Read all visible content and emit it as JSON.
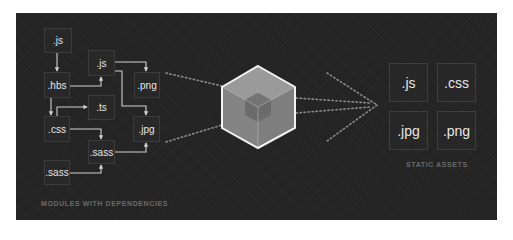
{
  "diagram": {
    "colors": {
      "background": "#242424",
      "box_border": "#3b3b3b",
      "text": "#e6e6e6",
      "arrow": "#cfcfcf",
      "dots": "#8a8a8a",
      "caption": "#6a6a6a"
    },
    "modules": {
      "caption": "MODULES WITH DEPENDENCIES",
      "items": [
        {
          "id": "js1",
          "label": ".js"
        },
        {
          "id": "js2",
          "label": ".js"
        },
        {
          "id": "hbs",
          "label": ".hbs"
        },
        {
          "id": "png",
          "label": ".png"
        },
        {
          "id": "ts",
          "label": ".ts"
        },
        {
          "id": "css",
          "label": ".css"
        },
        {
          "id": "jpg",
          "label": ".jpg"
        },
        {
          "id": "sass1",
          "label": ".sass"
        },
        {
          "id": "sass2",
          "label": ".sass"
        }
      ],
      "dependencies": [
        [
          "js1",
          "hbs"
        ],
        [
          "hbs",
          "js2"
        ],
        [
          "hbs",
          "css"
        ],
        [
          "css",
          "ts"
        ],
        [
          "js2",
          "png"
        ],
        [
          "js2",
          "jpg"
        ],
        [
          "css",
          "sass1"
        ],
        [
          "sass1",
          "jpg"
        ],
        [
          "sass2",
          "sass1"
        ]
      ]
    },
    "bundler": {
      "icon": "webpack-cube-icon"
    },
    "assets": {
      "caption": "STATIC ASSETS",
      "items": [
        {
          "label": ".js"
        },
        {
          "label": ".css"
        },
        {
          "label": ".jpg"
        },
        {
          "label": ".png"
        }
      ]
    }
  }
}
